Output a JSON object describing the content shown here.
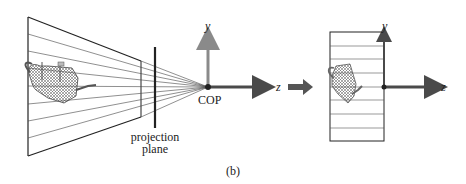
{
  "figure": {
    "caption": "(b)",
    "left_panel": {
      "cop_label": "COP",
      "projection_plane_label_line1": "projection",
      "projection_plane_label_line2": "plane",
      "y_axis_label": "y",
      "z_axis_label": "z"
    },
    "right_panel": {
      "y_axis_label": "y",
      "z_axis_label": "z"
    },
    "colors": {
      "y_axis": "#8a8a8a",
      "z_axis": "#4a4a4a",
      "arrow": "#555555",
      "lines": "#333333",
      "teapot": "#666666"
    }
  }
}
